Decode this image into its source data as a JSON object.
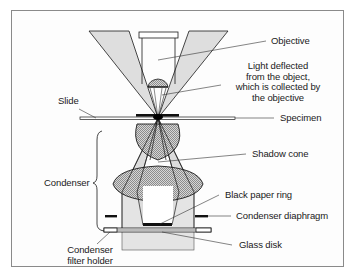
{
  "diagram": {
    "labels": {
      "objective": "Objective",
      "light_deflected": [
        "Light deflected",
        "from the object,",
        "which is collected by",
        "the objective"
      ],
      "slide": "Slide",
      "specimen": "Specimen",
      "shadow_cone": "Shadow cone",
      "condenser": "Condenser",
      "black_paper_ring": "Black paper ring",
      "condenser_diaphragm": "Condenser diaphragm",
      "glass_disk": "Glass disk",
      "condenser_filter_holder": [
        "Condenser",
        "filter holder"
      ]
    },
    "colors": {
      "light_fill": "#d9d9d9",
      "lens_fill": "#b8b8b8",
      "body_fill": "#e4e4e4",
      "line": "#1a1a1a",
      "frame": "#8a8a8a"
    }
  }
}
